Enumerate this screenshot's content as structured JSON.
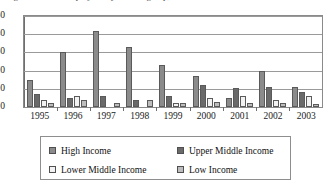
{
  "figure": {
    "title_partial": "Figure: Number of projects by income group, 1995-2003"
  },
  "chart_data": {
    "type": "bar",
    "title": "",
    "xlabel": "",
    "ylabel": "",
    "ylim": [
      0,
      50
    ],
    "yticks": [
      50,
      40,
      30,
      20,
      10,
      0
    ],
    "grid": true,
    "legend_position": "bottom",
    "categories": [
      "1995",
      "1996",
      "1997",
      "1998",
      "1999",
      "2000",
      "2001",
      "2002",
      "2003"
    ],
    "series": [
      {
        "name": "High Income",
        "color": "#8b8b8b",
        "values": [
          15,
          30,
          42,
          33,
          23,
          17,
          5,
          20,
          11
        ]
      },
      {
        "name": "Upper Middle Income",
        "color": "#6a6a6a",
        "values": [
          7,
          5,
          6,
          4,
          6,
          12,
          10.5,
          11,
          8
        ]
      },
      {
        "name": "Lower Middle Income",
        "color": "#f2f2f2",
        "values": [
          4,
          6,
          0,
          0,
          2,
          5,
          6,
          4,
          6
        ]
      },
      {
        "name": "Low Income",
        "color": "#bdbdbd",
        "values": [
          2,
          4,
          2,
          4,
          2,
          3,
          2,
          2,
          1.5
        ]
      }
    ]
  }
}
